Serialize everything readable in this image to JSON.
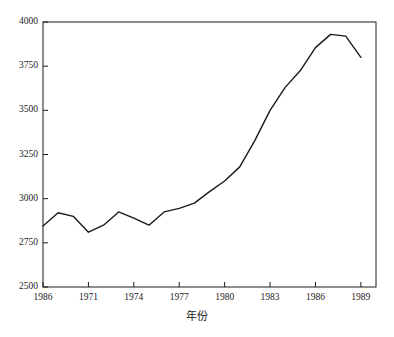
{
  "chart_data": {
    "type": "line",
    "title": "",
    "subtitle": "",
    "xlabel": "年份",
    "ylabel": "",
    "grid": false,
    "legend": null,
    "xlim": [
      1968,
      1990
    ],
    "ylim": [
      2500,
      4000
    ],
    "x_tick_labels": [
      "1986",
      "1971",
      "1974",
      "1977",
      "1980",
      "1983",
      "1986",
      "1989"
    ],
    "x_tick_values": [
      1968,
      1971,
      1974,
      1977,
      1980,
      1983,
      1986,
      1989
    ],
    "y_tick_labels": [
      "2500",
      "2750",
      "3000",
      "3250",
      "3500",
      "3750",
      "4000"
    ],
    "y_tick_values": [
      2500,
      2750,
      3000,
      3250,
      3500,
      3750,
      4000
    ],
    "series": [
      {
        "name": "series-1",
        "color": "#1a1a1a",
        "x": [
          1968,
          1969,
          1970,
          1971,
          1972,
          1973,
          1974,
          1975,
          1976,
          1977,
          1978,
          1979,
          1980,
          1981,
          1982,
          1983,
          1984,
          1985,
          1986,
          1987,
          1988,
          1989
        ],
        "values": [
          2845,
          2920,
          2900,
          2810,
          2850,
          2925,
          2890,
          2850,
          2925,
          2945,
          2975,
          3040,
          3100,
          3180,
          3330,
          3500,
          3630,
          3725,
          3855,
          3930,
          3920,
          3800
        ]
      }
    ]
  },
  "axes": {
    "frame_color": "#1a1a1a",
    "line_color": "#1a1a1a"
  }
}
